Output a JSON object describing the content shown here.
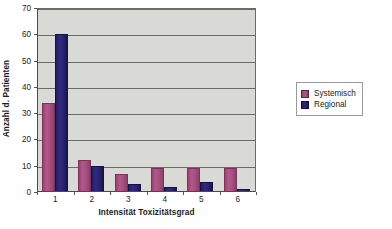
{
  "chart_data": {
    "type": "bar",
    "title": "",
    "subtitle": "",
    "xlabel": "Intensität Toxizitätsgrad",
    "ylabel": "Anzahl d. Patienten",
    "categories": [
      "1",
      "2",
      "3",
      "4",
      "5",
      "6"
    ],
    "series": [
      {
        "name": "Systemisch",
        "color": "#a44d7d",
        "values": [
          34,
          12,
          7,
          9,
          9,
          9
        ]
      },
      {
        "name": "Regional",
        "color": "#282070",
        "values": [
          60,
          10,
          3,
          2,
          4,
          1
        ]
      }
    ],
    "ylim": [
      0,
      70
    ],
    "y_ticks": [
      0,
      10,
      20,
      30,
      40,
      50,
      60,
      70
    ],
    "y_tick_labels": [
      "0",
      "10",
      "20",
      "30",
      "40",
      "50",
      "60",
      "70"
    ],
    "grid": "horizontal",
    "legend_position": "right",
    "plot_background": "#d9d9d5",
    "page_background": "#ffffff"
  }
}
